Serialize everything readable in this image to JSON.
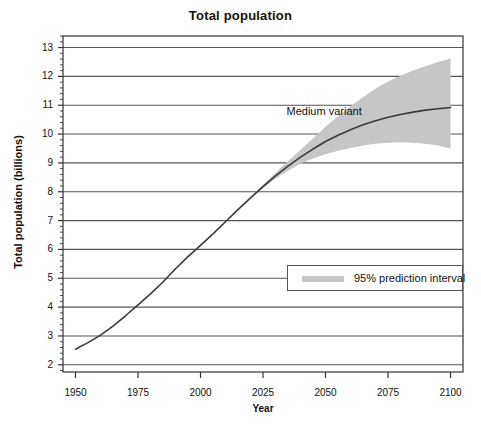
{
  "chart_data": {
    "type": "line",
    "title": "Total population",
    "xlabel": "Year",
    "ylabel": "Total population (billions)",
    "xlim": [
      1945,
      2105
    ],
    "ylim": [
      1.75,
      13.4
    ],
    "grid": true,
    "x_ticks": [
      1950,
      1975,
      2000,
      2025,
      2050,
      2075,
      2100
    ],
    "x_tick_labels": [
      "1950",
      "1975",
      "2000",
      "2025",
      "2050",
      "2075",
      "2100"
    ],
    "y_ticks": [
      2,
      3,
      4,
      5,
      6,
      7,
      8,
      9,
      10,
      11,
      12,
      13
    ],
    "y_tick_labels": [
      "2",
      "3",
      "4",
      "5",
      "6",
      "7",
      "8",
      "9",
      "10",
      "11",
      "12",
      "13"
    ],
    "y_minor_ticks_per_interval": 4,
    "legend": {
      "position": "inside-lower-right",
      "entries": [
        {
          "label": "95% prediction interval",
          "type": "band",
          "color": "#c6c6c6"
        }
      ]
    },
    "annotations": [
      {
        "text": "Medium variant",
        "x": 2052,
        "y": 10.75
      }
    ],
    "series": [
      {
        "name": "Medium variant",
        "type": "line",
        "color": "#3a3a3a",
        "x": [
          1950,
          1955,
          1960,
          1965,
          1970,
          1975,
          1980,
          1985,
          1990,
          1995,
          2000,
          2005,
          2010,
          2015,
          2020,
          2025,
          2030,
          2035,
          2040,
          2045,
          2050,
          2055,
          2060,
          2065,
          2070,
          2075,
          2080,
          2085,
          2090,
          2095,
          2100
        ],
        "values": [
          2.54,
          2.77,
          3.03,
          3.34,
          3.7,
          4.08,
          4.46,
          4.87,
          5.33,
          5.75,
          6.14,
          6.54,
          6.96,
          7.38,
          7.79,
          8.18,
          8.55,
          8.89,
          9.2,
          9.48,
          9.74,
          9.96,
          10.15,
          10.32,
          10.46,
          10.58,
          10.68,
          10.76,
          10.83,
          10.88,
          10.92
        ]
      },
      {
        "name": "95% prediction interval",
        "type": "band",
        "color": "#c6c6c6",
        "x": [
          2020,
          2025,
          2030,
          2035,
          2040,
          2045,
          2050,
          2055,
          2060,
          2065,
          2070,
          2075,
          2080,
          2085,
          2090,
          2095,
          2100
        ],
        "upper": [
          7.82,
          8.24,
          8.66,
          9.06,
          9.46,
          9.85,
          10.25,
          10.62,
          10.96,
          11.28,
          11.57,
          11.82,
          12.02,
          12.2,
          12.35,
          12.5,
          12.62
        ],
        "lower": [
          7.76,
          8.13,
          8.45,
          8.73,
          8.98,
          9.15,
          9.3,
          9.42,
          9.52,
          9.6,
          9.66,
          9.7,
          9.72,
          9.7,
          9.66,
          9.6,
          9.5
        ]
      }
    ]
  },
  "geometry": {
    "plot_left": 63,
    "plot_right": 463,
    "plot_top": 36,
    "plot_bottom": 372
  },
  "colors": {
    "line": "#3a3a3a",
    "band": "#c6c6c6",
    "grid": "#555555",
    "axis": "#333333",
    "background": "#ffffff"
  }
}
